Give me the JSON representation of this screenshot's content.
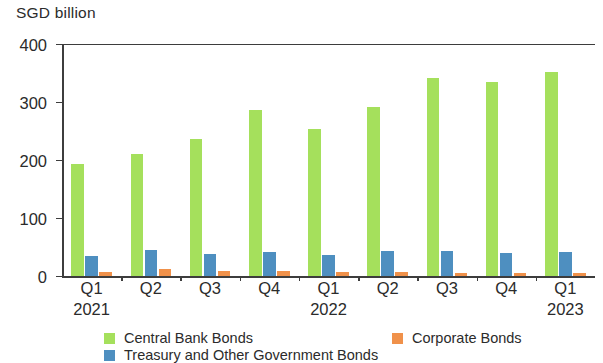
{
  "chart_data": {
    "type": "bar",
    "title": "",
    "ylabel": "SGD billion",
    "xlabel": "",
    "ylim": [
      0,
      400
    ],
    "yticks": [
      0,
      100,
      200,
      300,
      400
    ],
    "grid": false,
    "legend_position": "bottom",
    "categories": [
      {
        "quarter": "Q1",
        "year": "2021"
      },
      {
        "quarter": "Q2",
        "year": ""
      },
      {
        "quarter": "Q3",
        "year": ""
      },
      {
        "quarter": "Q4",
        "year": ""
      },
      {
        "quarter": "Q1",
        "year": "2022"
      },
      {
        "quarter": "Q2",
        "year": ""
      },
      {
        "quarter": "Q3",
        "year": ""
      },
      {
        "quarter": "Q4",
        "year": ""
      },
      {
        "quarter": "Q1",
        "year": "2023"
      }
    ],
    "series": [
      {
        "name": "Central Bank Bonds",
        "color": "#a5e05c",
        "values": [
          193,
          210,
          237,
          286,
          254,
          291,
          341,
          334,
          352
        ]
      },
      {
        "name": "Treasury and Other Government Bonds",
        "color": "#4e8fc0",
        "values": [
          35,
          44,
          38,
          41,
          37,
          43,
          43,
          39,
          41
        ]
      },
      {
        "name": "Corporate Bonds",
        "color": "#f0914a",
        "values": [
          7,
          12,
          9,
          9,
          7,
          7,
          6,
          6,
          5
        ]
      }
    ]
  },
  "axis": {
    "unit_title": "SGD billion",
    "tick_labels": [
      "400",
      "300",
      "200",
      "100",
      "0"
    ]
  },
  "legend": {
    "items": [
      {
        "label": "Central Bank Bonds",
        "color": "#a5e05c"
      },
      {
        "label": "Corporate Bonds",
        "color": "#f0914a"
      },
      {
        "label": "Treasury and Other Government Bonds",
        "color": "#4e8fc0"
      }
    ]
  }
}
